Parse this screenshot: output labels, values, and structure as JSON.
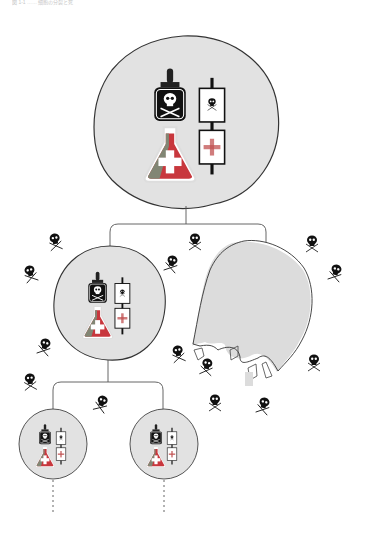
{
  "caption": "図 1-1 …… 細胞の分裂と死",
  "colors": {
    "cell_fill": "#e2e2e2",
    "cell_stroke": "#333333",
    "connector": "#555555",
    "poison": "#111111",
    "flask_red": "#c8373d",
    "flask_green": "#7a8f7a",
    "cross_red": "#c05050",
    "burst_fill": "#dcdcdc"
  },
  "diagram": {
    "type": "cell-lineage-tree",
    "root": {
      "name": "parent-cell",
      "contents": [
        "poison-bottle",
        "antidote-flask",
        "toxin-gene-box",
        "antitoxin-gene-box"
      ]
    },
    "children": [
      {
        "name": "daughter-cell-with-plasmid",
        "fate": "survives",
        "children": [
          {
            "name": "granddaughter-cell-1",
            "fate": "continues"
          },
          {
            "name": "granddaughter-cell-2",
            "fate": "continues"
          }
        ]
      },
      {
        "name": "daughter-cell-without-plasmid",
        "fate": "lysed"
      }
    ],
    "free_toxins": 14
  }
}
